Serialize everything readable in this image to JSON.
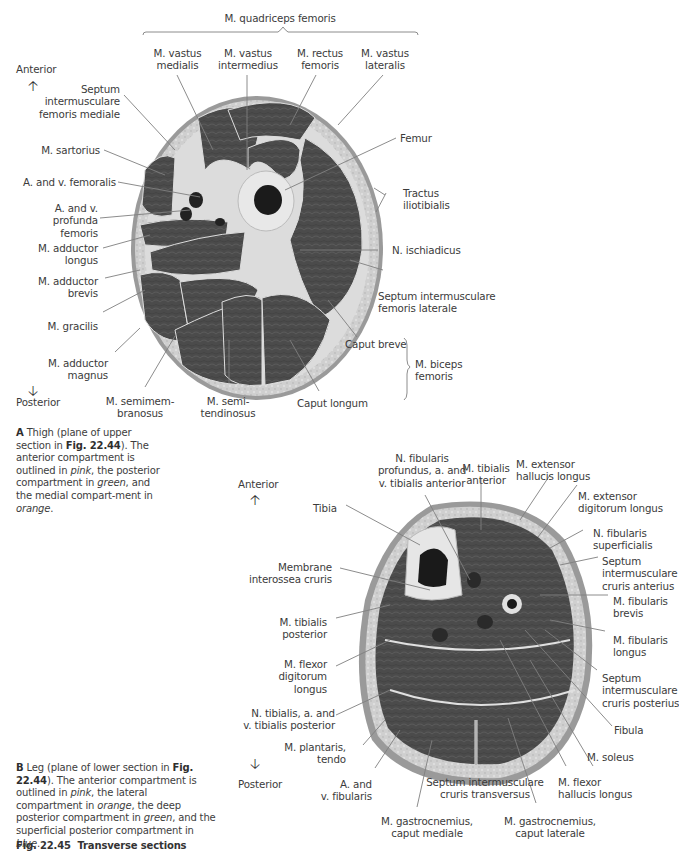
{
  "thigh": {
    "group_label": "M. quadriceps femoris",
    "orientation": {
      "anterior": "Anterior",
      "posterior": "Posterior"
    },
    "labels": {
      "vastus_medialis": "M. vastus\nmedialis",
      "vastus_intermedius": "M. vastus\nintermedius",
      "rectus_femoris": "M. rectus\nfemoris",
      "vastus_lateralis": "M. vastus\nlateralis",
      "septum_mediale": "Septum\nintermusculare\nfemoris mediale",
      "sartorius": "M. sartorius",
      "femoralis": "A. and v. femoralis",
      "profunda": "A. and v.\nprofunda\nfemoris",
      "adductor_longus": "M. adductor\nlongus",
      "adductor_brevis": "M. adductor\nbrevis",
      "gracilis": "M. gracilis",
      "adductor_magnus": "M. adductor\nmagnus",
      "semimembranosus": "M. semimem-\nbranosus",
      "semitendinosus": "M. semi-\ntendinosus",
      "caput_longum": "Caput longum",
      "caput_breve": "Caput breve",
      "biceps_femoris": "M. biceps\nfemoris",
      "femur": "Femur",
      "tractus": "Tractus\niliotibialis",
      "ischiadicus": "N. ischiadicus",
      "septum_laterale": "Septum intermusculare\nfemoris laterale"
    },
    "caption": {
      "letter": "A",
      "text_1": "Thigh (plane of upper section in ",
      "fig_ref": "Fig. 22.44",
      "text_2": "). The anterior compartment is outlined in ",
      "c1": "pink",
      "text_3": ", the posterior compartment in ",
      "c2": "green",
      "text_4": ", and the medial compart-ment in ",
      "c3": "orange",
      "text_5": "."
    }
  },
  "leg": {
    "orientation": {
      "anterior": "Anterior",
      "posterior": "Posterior"
    },
    "labels": {
      "fibularis_profundus": "N. fibularis\nprofundus, a. and\nv. tibialis anterior",
      "tibialis_anterior": "M. tibialis\nanterior",
      "ext_hallucis": "M. extensor\nhallucis longus",
      "ext_digitorum": "M. extensor\ndigitorum longus",
      "fib_superficialis": "N. fibularis\nsuperficialis",
      "septum_anterius": "Septum\nintermusculare\ncruris anterius",
      "fib_brevis": "M. fibularis\nbrevis",
      "fib_longus": "M. fibularis\nlongus",
      "septum_posterius": "Septum\nintermusculare\ncruris posterius",
      "fibula": "Fibula",
      "soleus": "M. soleus",
      "flexor_hallucis": "M. flexor\nhallucis longus",
      "gastro_lat": "M. gastrocnemius,\ncaput laterale",
      "septum_transversus": "Septum intermusculare\ncruris transversus",
      "gastro_med": "M. gastrocnemius,\ncaput mediale",
      "a_fibularis": "A. and\nv. fibularis",
      "plantaris": "M. plantaris,\ntendo",
      "n_tibialis": "N. tibialis, a. and\nv. tibialis posterior",
      "flexor_digitorum": "M. flexor\ndigitorum\nlongus",
      "tibialis_posterior": "M. tibialis\nposterior",
      "membrane": "Membrane\ninterossea cruris",
      "tibia": "Tibia"
    },
    "caption": {
      "letter": "B",
      "text_1": "Leg (plane of lower section in ",
      "fig_ref": "Fig. 22.44",
      "text_2": "). The anterior compartment is outlined in ",
      "c1": "pink",
      "text_3": ", the lateral compartment in ",
      "c2": "orange",
      "text_4": ", the deep posterior compartment in ",
      "c3": "green",
      "text_5": ", and the superficial posterior compartment in ",
      "c4": "blue",
      "text_6": "."
    }
  },
  "figure": {
    "number": "Fig. 22.45",
    "title": "Transverse sections"
  },
  "colors": {
    "skin": "#d4d4d4",
    "fat": "#c9c9c9",
    "muscle": "#4a4a4a",
    "bone": "#e6e6e6",
    "marrow": "#1a1a1a",
    "leader": "#7a7a7a"
  }
}
